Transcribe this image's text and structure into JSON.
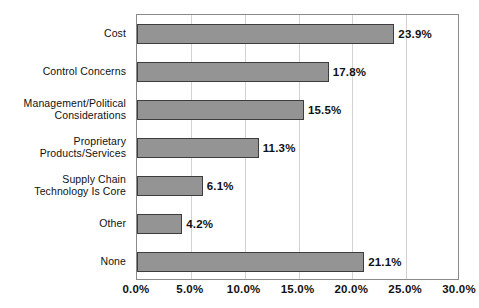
{
  "chart_data": {
    "type": "bar",
    "orientation": "horizontal",
    "title": "",
    "xlabel": "",
    "ylabel": "",
    "xlim": [
      0,
      30
    ],
    "xticks": [
      "0.0%",
      "5.0%",
      "10.0%",
      "15.0%",
      "20.0%",
      "25.0%",
      "30.0%"
    ],
    "xtick_values": [
      0,
      5,
      10,
      15,
      20,
      25,
      30
    ],
    "grid": true,
    "legend": false,
    "categories": [
      "Cost",
      "Control Concerns",
      "Management/Political\nConsiderations",
      "Proprietary\nProducts/Services",
      "Supply Chain\nTechnology Is Core",
      "Other",
      "None"
    ],
    "values": [
      23.9,
      17.8,
      15.5,
      11.3,
      6.1,
      4.2,
      21.1
    ],
    "value_labels": [
      "23.9%",
      "17.8%",
      "15.5%",
      "11.3%",
      "6.1%",
      "4.2%",
      "21.1%"
    ],
    "colors": {
      "bar_fill": "#949494",
      "bar_border": "#3d3d3d",
      "gridline": "#d2d2d2",
      "plot_border": "#8a8a8a",
      "background": "#ffffff",
      "text": "#111111"
    }
  }
}
